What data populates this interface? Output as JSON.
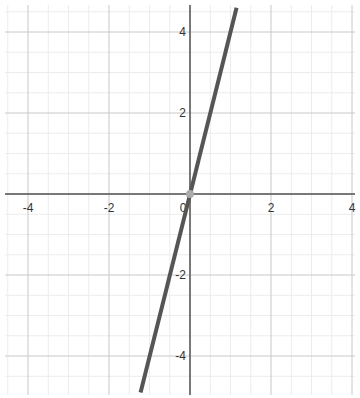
{
  "chart_data": {
    "type": "line",
    "title": "",
    "xlabel": "",
    "ylabel": "",
    "xlim": [
      -4.6,
      4.1
    ],
    "ylim": [
      -5.0,
      4.7
    ],
    "grid": true,
    "major_step": 2,
    "minor_step": 0.5,
    "x_ticks": [
      "-4",
      "-2",
      "0",
      "2",
      "4"
    ],
    "y_ticks": [
      "4",
      "2",
      "-2",
      "-4"
    ],
    "series": [
      {
        "name": "y = 4x",
        "equation": "y = 4x",
        "slope": 4,
        "intercept": 0,
        "x": [
          -1.22,
          1.15
        ],
        "y": [
          -4.9,
          4.6
        ],
        "color": "#555555"
      }
    ],
    "points": [
      {
        "x": 0,
        "y": 0,
        "color": "#aaaaaa"
      }
    ],
    "legend": "none"
  },
  "colors": {
    "axis": "#555555",
    "major_grid": "#c8c8c8",
    "minor_grid": "#ececec",
    "line": "#555555",
    "point": "#aaaaaa"
  }
}
